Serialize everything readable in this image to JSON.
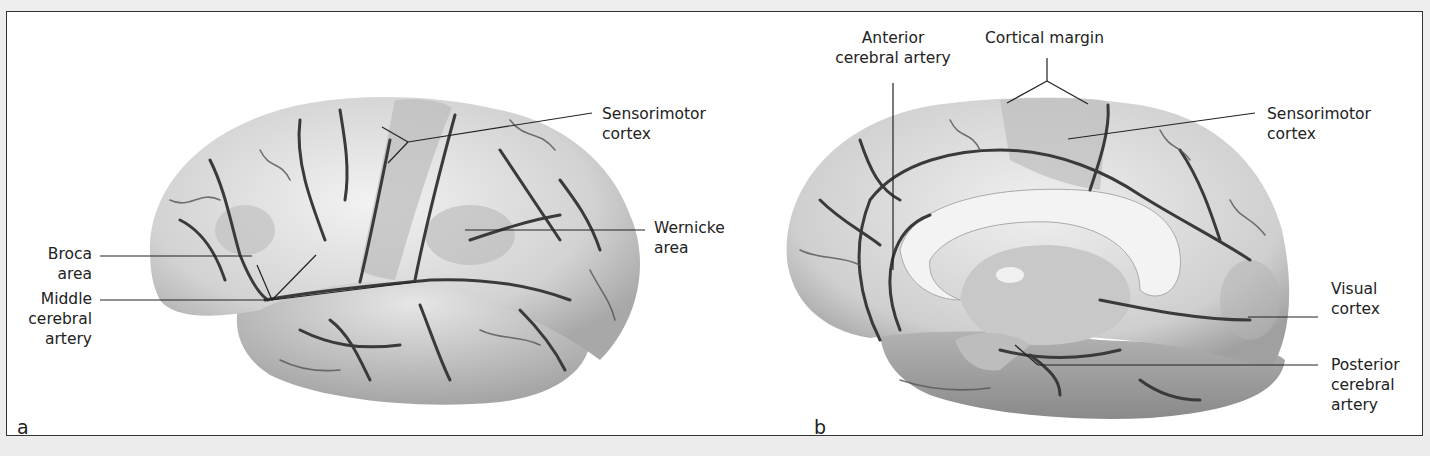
{
  "figure": {
    "panels": [
      {
        "id": "a",
        "letter": "a",
        "view": "lateral brain surface",
        "labels": {
          "broca_1": "Broca",
          "broca_2": "area",
          "mca_1": "Middle",
          "mca_2": "cerebral",
          "mca_3": "artery",
          "sensorimotor_1": "Sensorimotor",
          "sensorimotor_2": "cortex",
          "wernicke_1": "Wernicke",
          "wernicke_2": "area"
        }
      },
      {
        "id": "b",
        "letter": "b",
        "view": "medial brain surface",
        "labels": {
          "aca_1": "Anterior",
          "aca_2": "cerebral artery",
          "cortical_margin": "Cortical margin",
          "sensorimotor_1": "Sensorimotor",
          "sensorimotor_2": "cortex",
          "visual_1": "Visual",
          "visual_2": "cortex",
          "pca_1": "Posterior",
          "pca_2": "cerebral",
          "pca_3": "artery"
        }
      }
    ],
    "colors": {
      "border": "#333333",
      "brain_light": "#e4e4e4",
      "brain_mid": "#bdbdbd",
      "brain_dark": "#8f8f8f",
      "vessel": "#3a3a3a",
      "leader": "#222222"
    }
  }
}
